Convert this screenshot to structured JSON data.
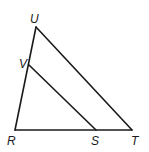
{
  "diagram": {
    "type": "triangle-with-parallel-segment",
    "points": {
      "U": {
        "x": 36,
        "y": 27,
        "label": "U",
        "lx": 30,
        "ly": 23
      },
      "V": {
        "x": 29,
        "y": 65,
        "label": "V",
        "lx": 19,
        "ly": 68
      },
      "R": {
        "x": 15,
        "y": 130,
        "label": "R",
        "lx": 7,
        "ly": 145
      },
      "S": {
        "x": 96,
        "y": 130,
        "label": "S",
        "lx": 91,
        "ly": 145
      },
      "T": {
        "x": 132,
        "y": 130,
        "label": "T",
        "lx": 131,
        "ly": 145
      }
    },
    "segments": [
      {
        "from": "U",
        "to": "R",
        "name": "segment-UR"
      },
      {
        "from": "U",
        "to": "T",
        "name": "segment-UT"
      },
      {
        "from": "R",
        "to": "T",
        "name": "segment-RT"
      },
      {
        "from": "V",
        "to": "S",
        "name": "segment-VS"
      }
    ],
    "stroke_color": "#1a1a1a",
    "background": "#ffffff"
  }
}
